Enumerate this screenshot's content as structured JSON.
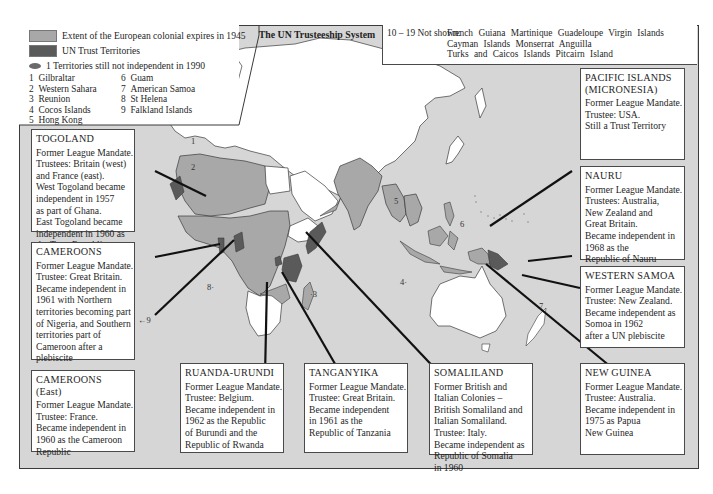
{
  "map_title": "The UN Trusteeship System",
  "legend": {
    "items": [
      {
        "label": "Extent of the European colonial expires in 1945",
        "color": "#a8a8a8"
      },
      {
        "label": "UN Trust Territories",
        "color": "#5a5a5a"
      },
      {
        "label": "1   Territories still not independent in 1990",
        "marker": "ellipse",
        "color": "#6a6a6a"
      }
    ],
    "territories": [
      {
        "num": "1",
        "name": "Gilbraltar"
      },
      {
        "num": "2",
        "name": "Western Sahara"
      },
      {
        "num": "3",
        "name": "Reunion"
      },
      {
        "num": "4",
        "name": "Cocos Islands"
      },
      {
        "num": "5",
        "name": "Hong Kong"
      },
      {
        "num": "6",
        "name": "Guam"
      },
      {
        "num": "7",
        "name": "American Samoa"
      },
      {
        "num": "8",
        "name": "St Helena"
      },
      {
        "num": "9",
        "name": "Falkland Islands"
      }
    ]
  },
  "not_shown": {
    "label": "10 – 19  Not shown:",
    "rows": [
      "French Guiana    Martinique    Guadeloupe    Virgin Islands",
      "Cayman Islands   Monserrat    Anguilla",
      "Turks and Caicos Islands   Pitcairn Island"
    ]
  },
  "map_labels": [
    "1",
    "2",
    "3",
    "4",
    "5",
    "6",
    "7",
    "8",
    "9"
  ],
  "callouts": {
    "togoland": {
      "title": "TOGOLAND",
      "lines": [
        "Former League Mandate.",
        "Trustees: Britain (west)",
        "and France (east).",
        "West Togoland became",
        "independent in 1957",
        "as part of Ghana.",
        "East Togoland became",
        "independent in 1960 as",
        "the Togo Republic"
      ]
    },
    "cameroons": {
      "title": "CAMEROONS",
      "lines": [
        "Former League Mandate.",
        "Trustee: Great Britain.",
        "Became independent in",
        "1961 with Northern",
        "territories becoming part",
        "of Nigeria, and Southern",
        "territories part of",
        "Cameroon after a",
        "plebiscite"
      ]
    },
    "cameroons_east": {
      "title": "CAMEROONS (East)",
      "lines": [
        "Former League Mandate.",
        "Trustee: France.",
        "Became independent in",
        "1960 as the Cameroon",
        "Republic"
      ]
    },
    "ruanda_urundi": {
      "title": "RUANDA-URUNDI",
      "lines": [
        "Former League Mandate.",
        "Trustee: Belgium.",
        "Became independent in",
        "1962 as the Republic",
        "of Burundi and the",
        "Republic of Rwanda"
      ]
    },
    "tanganyika": {
      "title": "TANGANYIKA",
      "lines": [
        "Former League Mandate.",
        "Trustee: Great Britain.",
        "Became independent",
        "in 1961 as the",
        "Republic of Tanzania"
      ]
    },
    "somaliland": {
      "title": "SOMALILAND",
      "lines": [
        "Former British and",
        "Italian Colonies –",
        "British Somaliland and",
        "Italian Somaliland.",
        "Trustee: Italy.",
        "Became independent as",
        "Republic of Somalia",
        "in 1960"
      ]
    },
    "pacific_islands": {
      "title": "PACIFIC ISLANDS",
      "title2": "(MICRONESIA)",
      "lines": [
        "Former League Mandate.",
        "Trustee: USA.",
        "Still a Trust Territory"
      ]
    },
    "nauru": {
      "title": "NAURU",
      "lines": [
        "Former League Mandate.",
        "Trustees: Australia,",
        "New Zealand and",
        "Great Britain.",
        "Became independent in",
        "1968 as the",
        "Republic of Nauru"
      ]
    },
    "western_samoa": {
      "title": "WESTERN SAMOA",
      "lines": [
        "Former League Mandate.",
        "Trustee: New Zealand.",
        "Became independent as",
        "Somoa in 1962",
        "after a UN plebiscite"
      ]
    },
    "new_guinea": {
      "title": "NEW GUINEA",
      "lines": [
        "Former League Mandate.",
        "Trustee: Australia.",
        "Became independent in",
        "1975 as Papua",
        "New Guinea"
      ]
    }
  },
  "colors": {
    "ocean": "#d6d6d6",
    "colonial": "#a8a8a8",
    "trust": "#5a5a5a",
    "independent_land": "#ffffff",
    "border": "#3a3a3a"
  }
}
